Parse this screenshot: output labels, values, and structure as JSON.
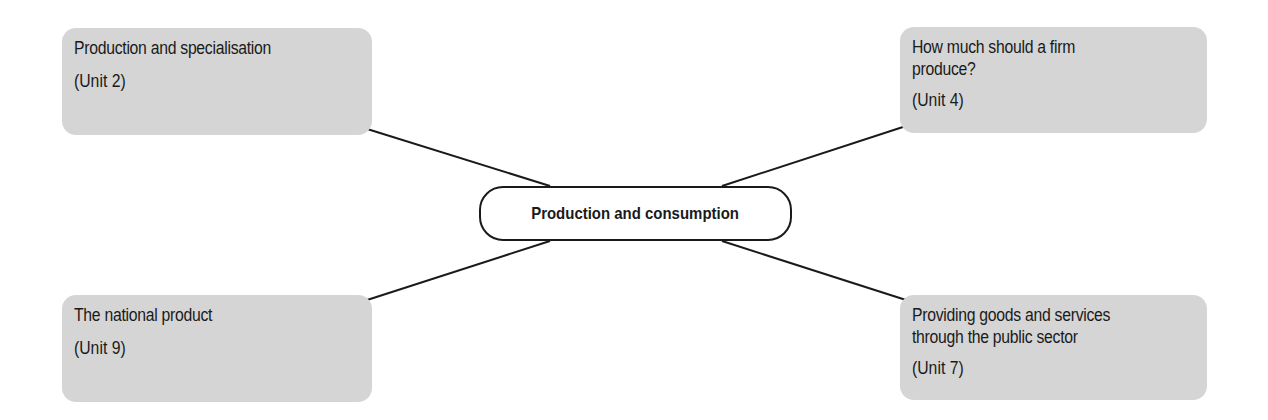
{
  "diagram": {
    "center": {
      "label": "Production and consumption"
    },
    "nodes": [
      {
        "title": "Production and specialisation",
        "unit": "(Unit 2)"
      },
      {
        "title": "How much should a firm\nproduce?",
        "unit": "(Unit 4)"
      },
      {
        "title": "The national product",
        "unit": "(Unit 9)"
      },
      {
        "title": "Providing goods and services\nthrough the public sector",
        "unit": "(Unit 7)"
      }
    ],
    "colors": {
      "node_fill": "#d5d5d5",
      "line": "#1a1a1a",
      "center_fill": "#ffffff"
    }
  }
}
